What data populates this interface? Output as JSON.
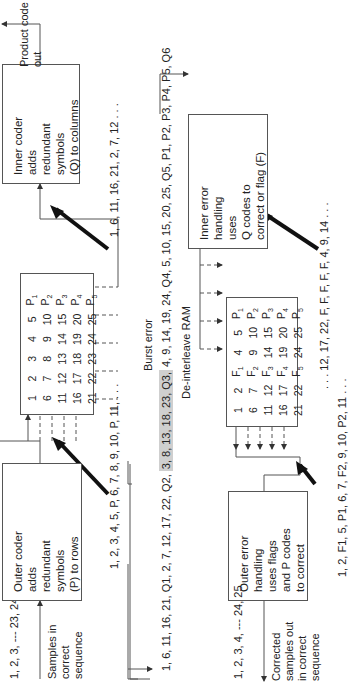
{
  "encoder": {
    "input_sequence": "1, 2, 3, --- 23, 24, 25",
    "input_label": [
      "Samples in",
      "correct",
      "sequence"
    ],
    "outer_coder": [
      "Outer coder",
      "adds",
      "redundant",
      "symbols",
      "(P) to rows"
    ],
    "row_sequence": "1, 2, 3, 4, 5, P, 6, 7, 8, 9, 10, P, 11, . . .",
    "column_sequence": "1, 6, 11, 16, 21, 2, 7, 12 . . .",
    "inner_coder": [
      "Inner coder",
      "adds",
      "redundant",
      "symbols",
      "(Q) to columns"
    ],
    "output_label": [
      "Product code",
      "out"
    ],
    "matrix": [
      [
        "1",
        "2",
        "3",
        "4",
        "5",
        "P1"
      ],
      [
        "6",
        "7",
        "8",
        "9",
        "10",
        "P2"
      ],
      [
        "11",
        "12",
        "13",
        "14",
        "15",
        "P3"
      ],
      [
        "16",
        "17",
        "18",
        "19",
        "20",
        "P4"
      ],
      [
        "21",
        "22",
        "23",
        "24",
        "25",
        "P5"
      ]
    ]
  },
  "channel": {
    "burst_label": "Burst error",
    "sequence_before": "1, 6, 11, 16, 21, Q1, 2, 7, 12, 17, 22, Q2,",
    "burst_segment": "3, 8, 13, 18, 23, Q3,",
    "sequence_after": "4, 9, 14, 19, 24, Q4, 5, 10, 15, 20, 25, Q5, P1, P2, P3, P4, P5, Q6"
  },
  "decoder": {
    "inner_handler": [
      "Inner error",
      "handling",
      "uses",
      "Q codes to",
      "correct or flag (F)"
    ],
    "column_sequence": ". . . 12, 17, 22, F, F, F, F, F, 4, 9, 14 . . .",
    "ram_label": "De-interleave RAM",
    "matrix": [
      [
        "1",
        "2",
        "F1",
        "4",
        "5",
        "P1"
      ],
      [
        "6",
        "7",
        "F2",
        "9",
        "10",
        "P2"
      ],
      [
        "11",
        "12",
        "F3",
        "14",
        "15",
        "P3"
      ],
      [
        "16",
        "17",
        "F4",
        "19",
        "20",
        "P4"
      ],
      [
        "21",
        "22",
        "F5",
        "24",
        "25",
        "P5"
      ]
    ],
    "row_sequence": "1, 2, F1, 5, P1, 6, 7, F2, 9, 10, P2, 11 . . .",
    "outer_handler": [
      "Outer error",
      "handling",
      "uses flags",
      "and P codes",
      "to correct"
    ],
    "output_sequence": "1, 2, 3, 4, --- 24, 25",
    "output_label": [
      "Corrected",
      "samples out",
      "in correct",
      "sequence"
    ]
  }
}
